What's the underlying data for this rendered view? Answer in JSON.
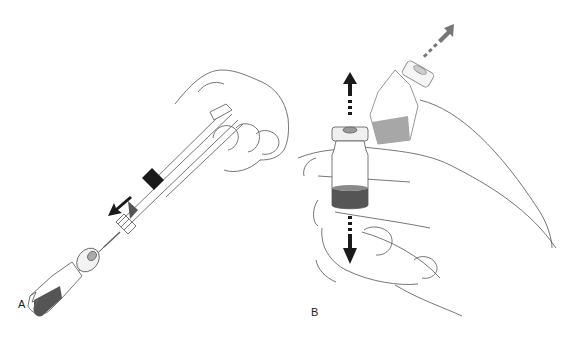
{
  "figure": {
    "panels": [
      {
        "id": "A",
        "label": "A",
        "description": "Hand holding syringe inserting needle into inverted vial; arrow indicates insertion direction"
      },
      {
        "id": "B",
        "label": "B",
        "description": "Hand holding vial, rolling/moving vial; arrows indicate up/down and diagonal motion"
      }
    ],
    "colors": {
      "outline": "#555555",
      "liquid_dark": "#555555",
      "liquid_mid": "#8a8a8a",
      "arrow_dark": "#1a1a1a",
      "arrow_gray": "#777777"
    }
  }
}
